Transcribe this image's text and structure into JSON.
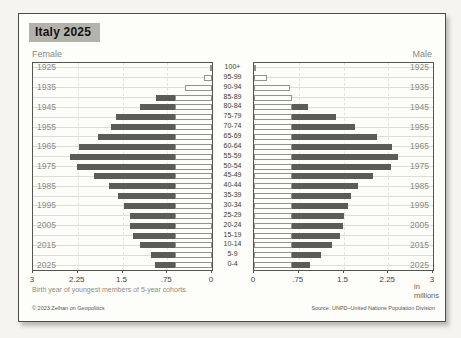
{
  "header": {
    "title": "Italy 2025"
  },
  "labels": {
    "female": "Female",
    "male": "Male",
    "unit": "in millions",
    "footnote": "Birth year of youngest members of 5-year cohorts.",
    "copyright": "© 2023 Zeihan on Geopolitics",
    "source": "Source: UNPD–United Nations Population Division"
  },
  "colors": {
    "bar_fill": "#5b5b58",
    "bar_outline": "#94938b",
    "title_bg": "#b3b2ab",
    "frame": "#4d4c48"
  },
  "chart_data": {
    "type": "bar",
    "subtype": "population_pyramid",
    "title": "Italy 2025",
    "unit": "millions",
    "xlim": [
      0,
      3
    ],
    "x_ticks": [
      0,
      0.75,
      1.5,
      2.25,
      3
    ],
    "x_tick_labels_female": [
      "3",
      "2.25",
      "1.5",
      ".75",
      "0"
    ],
    "x_tick_labels_male": [
      "0",
      ".75",
      "1.5",
      "2.25",
      "3"
    ],
    "age_groups": [
      "100+",
      "95-99",
      "90-94",
      "85-89",
      "80-84",
      "75-79",
      "70-74",
      "65-69",
      "60-64",
      "55-59",
      "50-54",
      "45-49",
      "40-44",
      "35-39",
      "30-34",
      "25-29",
      "20-24",
      "15-19",
      "10-14",
      "5-9",
      "0-4"
    ],
    "cohort_year_labels": [
      "1925",
      "1935",
      "1945",
      "1955",
      "1965",
      "1975",
      "1985",
      "1995",
      "2005",
      "2015",
      "2025"
    ],
    "series": [
      {
        "name": "female_outline",
        "style": "hollow",
        "values": [
          0.03,
          0.14,
          0.45,
          0.62,
          0.62,
          0.62,
          0.62,
          0.62,
          0.62,
          0.62,
          0.62,
          0.62,
          0.62,
          0.62,
          0.62,
          0.62,
          0.62,
          0.62,
          0.62,
          0.62,
          0.62
        ]
      },
      {
        "name": "female_solid",
        "style": "filled",
        "values": [
          null,
          null,
          null,
          0.94,
          1.21,
          1.61,
          1.69,
          1.91,
          2.23,
          2.38,
          2.27,
          1.98,
          1.72,
          1.58,
          1.47,
          1.37,
          1.37,
          1.32,
          1.2,
          1.03,
          0.96
        ]
      },
      {
        "name": "male_outline",
        "style": "hollow",
        "values": [
          0.04,
          0.21,
          0.6,
          0.63,
          0.63,
          0.63,
          0.63,
          0.63,
          0.63,
          0.63,
          0.63,
          0.63,
          0.63,
          0.63,
          0.63,
          0.63,
          0.63,
          0.63,
          0.63,
          0.63,
          0.63
        ]
      },
      {
        "name": "male_solid",
        "style": "filled",
        "values": [
          null,
          null,
          null,
          null,
          0.91,
          1.38,
          1.7,
          2.06,
          2.32,
          2.41,
          2.29,
          2.0,
          1.74,
          1.62,
          1.57,
          1.51,
          1.49,
          1.44,
          1.3,
          1.12,
          0.94
        ]
      }
    ]
  }
}
